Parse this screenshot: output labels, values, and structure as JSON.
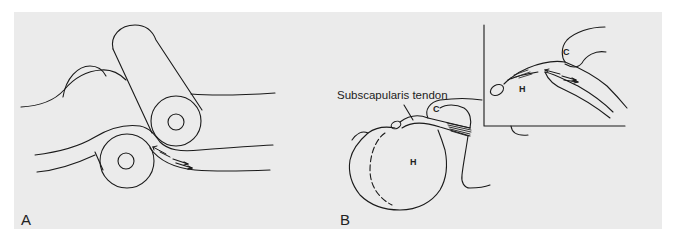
{
  "figure": {
    "background_color": "#ebebeb",
    "line_color": "#1a1a1a",
    "panels": [
      {
        "id": "A",
        "label": "A",
        "description": "Roller model: tendon band compressed between two cylinders, with arrows showing opposing shear"
      },
      {
        "id": "B",
        "label": "B",
        "annotation": "Subscapularis tendon",
        "structures": {
          "humerus_label": "H",
          "coracoid_label": "C"
        },
        "inset": {
          "humerus_label": "H",
          "coracoid_label": "C"
        }
      }
    ]
  }
}
